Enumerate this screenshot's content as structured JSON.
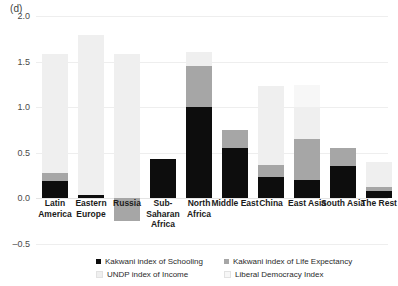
{
  "figure": {
    "panel_label": "(d)"
  },
  "legend": {
    "items": [
      {
        "label": "Kakwani index of Schooling",
        "color": "#0d0d0d",
        "key": "schooling"
      },
      {
        "label": "Kakwani index of Life Expectancy",
        "color": "#a6a6a6",
        "key": "life_expectancy"
      },
      {
        "label": "UNDP index of Income",
        "color": "#efefef",
        "key": "income"
      },
      {
        "label": "Liberal Democracy Index",
        "color": "#f7f7f7",
        "key": "democracy"
      }
    ]
  },
  "chart_data": {
    "type": "bar",
    "subtype": "stacked",
    "title": "(d)",
    "xlabel": "",
    "ylabel": "",
    "ylim": [
      -0.5,
      2.0
    ],
    "yticks": [
      -0.5,
      0.0,
      0.5,
      1.0,
      1.5,
      2.0
    ],
    "ytick_labels": [
      "-0.5",
      "0.0",
      "0.5",
      "1.0",
      "1.5",
      "2.0"
    ],
    "grid": true,
    "grid_axis": "y",
    "legend_position": "bottom",
    "legend_ncol": 2,
    "categories": [
      "Latin America",
      "Eastern Europe",
      "Russia",
      "Sub-Saharan Africa",
      "North Africa",
      "Middle East",
      "China",
      "East Asia",
      "South Asia",
      "The Rest"
    ],
    "category_lines": [
      [
        "Latin",
        "America"
      ],
      [
        "Eastern",
        "Europe"
      ],
      [
        "Russia"
      ],
      [
        "Sub-",
        "Saharan",
        "Africa"
      ],
      [
        "North",
        "Africa"
      ],
      [
        "Middle East"
      ],
      [
        "China"
      ],
      [
        "East Asia"
      ],
      [
        "South Asia"
      ],
      [
        "The Rest"
      ]
    ],
    "series": [
      {
        "name": "Kakwani index of Schooling",
        "color": "#0d0d0d",
        "values": [
          0.19,
          0.04,
          0.0,
          0.43,
          1.0,
          0.55,
          0.23,
          0.2,
          0.35,
          0.08
        ]
      },
      {
        "name": "Kakwani index of Life Expectancy",
        "color": "#a6a6a6",
        "values": [
          0.09,
          0.0,
          -0.25,
          0.0,
          0.45,
          0.2,
          0.14,
          0.45,
          0.2,
          0.04
        ]
      },
      {
        "name": "UNDP index of Income",
        "color": "#efefef",
        "values": [
          1.3,
          1.75,
          1.58,
          0.0,
          0.15,
          0.0,
          0.86,
          0.35,
          0.0,
          0.28
        ]
      },
      {
        "name": "Liberal Democracy Index",
        "color": "#f7f7f7",
        "values": [
          0.0,
          0.0,
          0.0,
          0.0,
          0.0,
          0.0,
          0.0,
          0.24,
          0.0,
          0.0
        ]
      }
    ],
    "totals_positive": [
      1.58,
      1.79,
      1.58,
      0.43,
      1.6,
      0.75,
      1.23,
      1.24,
      0.55,
      0.4
    ],
    "totals_negative": [
      0.0,
      0.0,
      -0.25,
      0.0,
      0.0,
      0.0,
      0.0,
      0.0,
      0.0,
      0.0
    ]
  }
}
